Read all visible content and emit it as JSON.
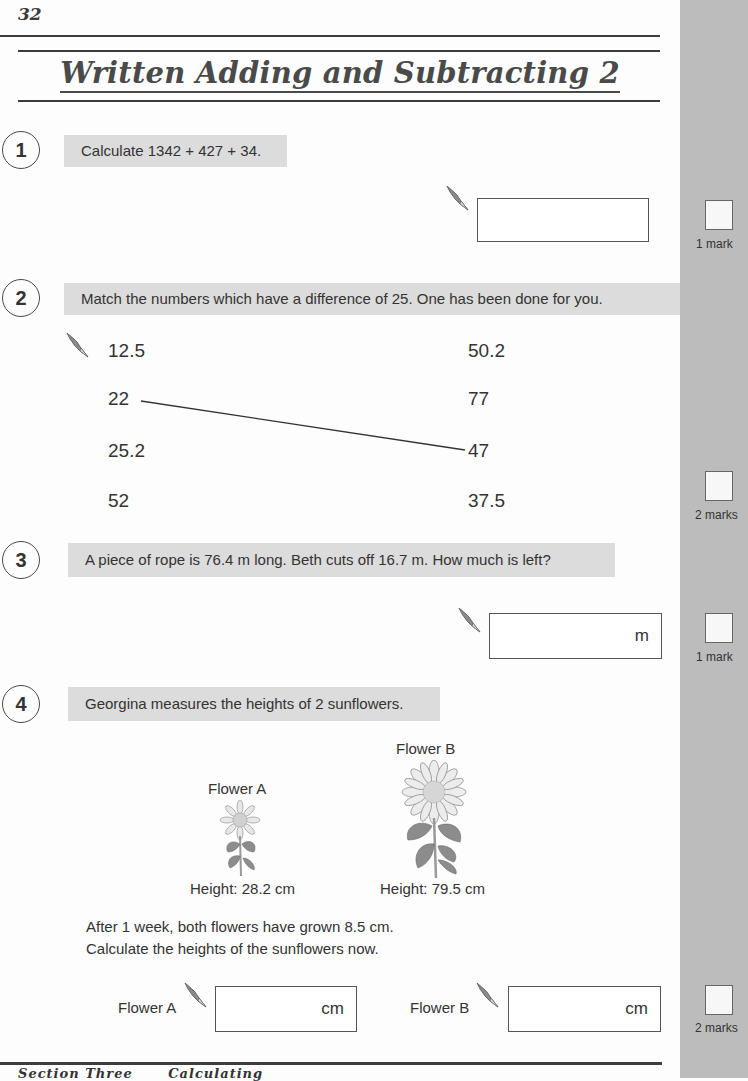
{
  "page": {
    "number": "32",
    "title": "Written Adding and Subtracting 2",
    "footer_left": "Section Three",
    "footer_right": "Calculating"
  },
  "colors": {
    "sidebar": "#bcbcbc",
    "question_band": "#dcdcdc",
    "rule": "#3c3c3c"
  },
  "questions": [
    {
      "number": "1",
      "prompt": "Calculate 1342 + 427 + 34.",
      "answer_value": "",
      "answer_unit": "",
      "marks_label": "1 mark"
    },
    {
      "number": "2",
      "prompt": "Match the numbers which have a difference of 25.  One has been done for you.",
      "left_numbers": [
        "12.5",
        "22",
        "25.2",
        "52"
      ],
      "right_numbers": [
        "50.2",
        "77",
        "47",
        "37.5"
      ],
      "example_match": {
        "from": "22",
        "to": "47"
      },
      "marks_label": "2 marks"
    },
    {
      "number": "3",
      "prompt": "A piece of rope is 76.4 m long.  Beth cuts off 16.7 m.  How much is left?",
      "answer_value": "",
      "answer_unit": "m",
      "marks_label": "1 mark"
    },
    {
      "number": "4",
      "prompt": "Georgina measures the heights of 2 sunflowers.",
      "flowers": [
        {
          "name": "Flower A",
          "height_label": "Height: 28.2 cm"
        },
        {
          "name": "Flower B",
          "height_label": "Height: 79.5 cm"
        }
      ],
      "instruction_line1": "After 1 week, both flowers have grown 8.5 cm.",
      "instruction_line2": "Calculate the heights of the sunflowers now.",
      "answers": [
        {
          "label": "Flower A",
          "value": "",
          "unit": "cm"
        },
        {
          "label": "Flower B",
          "value": "",
          "unit": "cm"
        }
      ],
      "marks_label": "2 marks"
    }
  ],
  "icons": {
    "pen": "pen-nib-icon",
    "sunflower": "sunflower-illustration"
  }
}
